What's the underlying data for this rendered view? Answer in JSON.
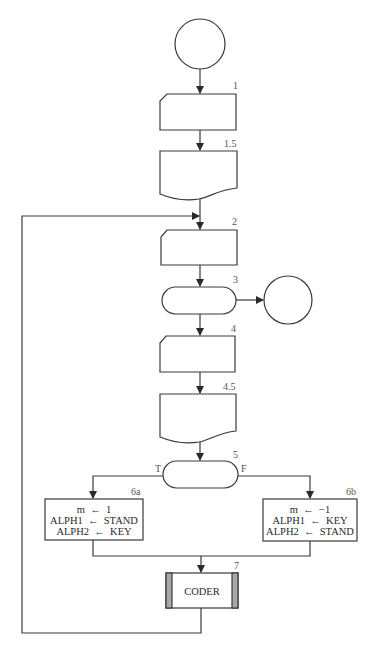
{
  "diagram": {
    "type": "flowchart",
    "nodes": {
      "start": {
        "shape": "connector-circle",
        "label": ""
      },
      "n1": {
        "number": "1",
        "shape": "card",
        "label": ""
      },
      "n1_5": {
        "number": "1.5",
        "shape": "document",
        "label": ""
      },
      "n2": {
        "number": "2",
        "shape": "card",
        "label": ""
      },
      "n3": {
        "number": "3",
        "shape": "terminal-decision",
        "label": ""
      },
      "exit": {
        "shape": "connector-circle",
        "label": ""
      },
      "n4": {
        "number": "4",
        "shape": "card",
        "label": ""
      },
      "n4_5": {
        "number": "4.5",
        "shape": "document",
        "label": ""
      },
      "n5": {
        "number": "5",
        "shape": "decision-oval",
        "label": "",
        "true_label": "T",
        "false_label": "F"
      },
      "n6a": {
        "number": "6a",
        "shape": "process",
        "lines": [
          "m  ←  1",
          "ALPH1  ←  STAND",
          "ALPH2  ←  KEY"
        ]
      },
      "n6b": {
        "number": "6b",
        "shape": "process",
        "lines": [
          "m  ←  −1",
          "ALPH1  ←  KEY",
          "ALPH2  ←  STAND"
        ]
      },
      "n7": {
        "number": "7",
        "shape": "predefined-process",
        "label": "CODER"
      }
    },
    "edges": [
      [
        "start",
        "n1"
      ],
      [
        "n1",
        "n1_5"
      ],
      [
        "n1_5",
        "n2"
      ],
      [
        "n2",
        "n3"
      ],
      [
        "n3",
        "exit"
      ],
      [
        "n3",
        "n4"
      ],
      [
        "n4",
        "n4_5"
      ],
      [
        "n4_5",
        "n5"
      ],
      [
        "n5:T",
        "n6a"
      ],
      [
        "n5:F",
        "n6b"
      ],
      [
        "n6a",
        "n7"
      ],
      [
        "n6b",
        "n7"
      ],
      [
        "n7",
        "n2"
      ]
    ]
  }
}
